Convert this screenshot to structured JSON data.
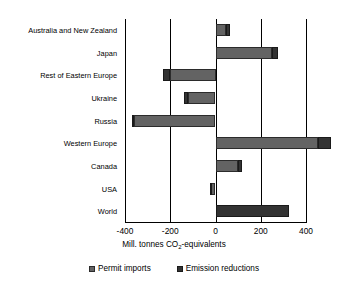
{
  "chart_data": {
    "type": "bar",
    "orientation": "horizontal",
    "stacked": true,
    "title": "",
    "xlabel": "Mill. tonnes CO2-equivalents",
    "xlabel_prefix": "Mill. tonnes CO",
    "xlabel_sub": "2",
    "xlabel_suffix": "-equivalents",
    "ylabel": "",
    "categories": [
      "Australia and New Zealand",
      "Japan",
      "Rest of Eastern Europe",
      "Ukraine",
      "Russia",
      "Western Europe",
      "Canada",
      "USA",
      "World"
    ],
    "series": [
      {
        "name": "Permit imports",
        "color": "#636363",
        "values": [
          45,
          250,
          -200,
          -120,
          -360,
          455,
          100,
          -20,
          0
        ]
      },
      {
        "name": "Emission reductions",
        "color": "#333333",
        "values": [
          20,
          25,
          30,
          18,
          8,
          55,
          18,
          5,
          325
        ]
      }
    ],
    "xlim": [
      -400,
      400
    ],
    "xticks": [
      -400,
      -200,
      0,
      200,
      400
    ],
    "xtick_labels": [
      "-400",
      "-200",
      "0",
      "200",
      "400"
    ],
    "grid": true,
    "grid_axis": "x",
    "legend_position": "bottom",
    "legend": [
      "Permit imports",
      "Emission reductions"
    ]
  }
}
